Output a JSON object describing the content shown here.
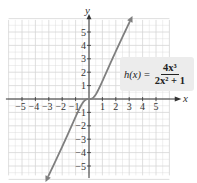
{
  "chart_data": {
    "type": "line",
    "title": "",
    "function_label": "h(x) = 4x^3 / (2x^2 + 1)",
    "formula": {
      "lhs": "h(x)",
      "eq": "=",
      "numerator": "4x³",
      "denominator": "2x² + 1"
    },
    "xlabel": "x",
    "ylabel": "y",
    "xlim": [
      -6,
      6
    ],
    "ylim": [
      -6,
      6
    ],
    "grid": true,
    "x_ticks": [
      "-5",
      "-4",
      "-3",
      "-2",
      "-1",
      "1",
      "2",
      "3",
      "4",
      "5"
    ],
    "y_ticks": [
      "5",
      "4",
      "3",
      "2",
      "1",
      "-1",
      "-2",
      "-3",
      "-4",
      "-5"
    ],
    "series": [
      {
        "name": "h(x)",
        "x": [
          -3.1,
          -2.5,
          -2.0,
          -1.5,
          -1.0,
          -0.5,
          0,
          0.5,
          1.0,
          1.5,
          2.0,
          2.5,
          3.1
        ],
        "y": [
          -6.0,
          -4.71,
          -3.56,
          -2.7,
          -1.33,
          -0.33,
          0,
          0.33,
          1.33,
          2.45,
          3.56,
          4.71,
          6.0
        ]
      }
    ],
    "arrows_on_ends": true,
    "colors": {
      "curve": "#7f7f7f",
      "grid": "#d6d6d6",
      "axis": "#333333",
      "formula_bg": "#ececec"
    }
  }
}
